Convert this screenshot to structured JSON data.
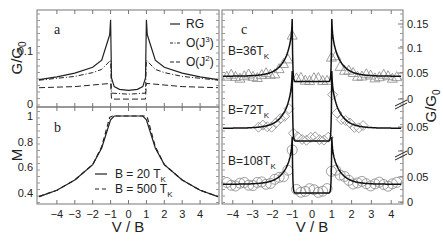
{
  "chart_data": [
    {
      "panel": "a",
      "type": "line",
      "xlabel": "",
      "ylabel": "G/G0",
      "xlim": [
        -5,
        5
      ],
      "ylim": [
        0,
        0.17
      ],
      "yticks": [
        "0",
        "0.1"
      ],
      "legend": [
        "RG",
        "O(J^3)",
        "O(J^2)"
      ],
      "legend_position": "upper right",
      "series": [
        {
          "name": "RG",
          "style": "solid",
          "x": [
            -5,
            -4,
            -3,
            -2,
            -1.5,
            -1.05,
            -1,
            -0.95,
            -0.8,
            -0.5,
            0,
            0.5,
            0.8,
            0.95,
            1,
            1.05,
            1.5,
            2,
            3,
            4,
            5
          ],
          "y": [
            0.047,
            0.052,
            0.059,
            0.07,
            0.083,
            0.13,
            0.158,
            0.05,
            0.034,
            0.029,
            0.027,
            0.029,
            0.034,
            0.05,
            0.158,
            0.13,
            0.083,
            0.07,
            0.059,
            0.052,
            0.047
          ]
        },
        {
          "name": "O(J^3)",
          "style": "dash-dot",
          "x": [
            -5,
            -3,
            -2,
            -1.5,
            -1,
            -0.95,
            0,
            0.95,
            1,
            1.5,
            2,
            3,
            5
          ],
          "y": [
            0.046,
            0.053,
            0.06,
            0.066,
            0.083,
            0.022,
            0.02,
            0.022,
            0.083,
            0.066,
            0.06,
            0.053,
            0.046
          ]
        },
        {
          "name": "O(J^2)",
          "style": "dashed",
          "x": [
            -5,
            -3,
            -1,
            -0.95,
            0,
            0.95,
            1,
            3,
            5
          ],
          "y": [
            0.032,
            0.034,
            0.04,
            0.011,
            0.011,
            0.011,
            0.04,
            0.034,
            0.032
          ]
        }
      ]
    },
    {
      "panel": "b",
      "type": "line",
      "xlabel": "V / B",
      "ylabel": "M",
      "xlim": [
        -5,
        5
      ],
      "ylim": [
        0.35,
        1.03
      ],
      "xticks": [
        "-4",
        "-3",
        "-2",
        "-1",
        "0",
        "1",
        "2",
        "3",
        "4"
      ],
      "yticks": [
        "0.4",
        "0.6",
        "0.8",
        "1"
      ],
      "legend": [
        "B = 20 T_K",
        "B = 500 T_K"
      ],
      "series": [
        {
          "name": "B = 20 T_K",
          "style": "solid",
          "x": [
            -5,
            -4,
            -3,
            -2,
            -1.5,
            -1,
            -0.8,
            0,
            0.8,
            1,
            1.5,
            2,
            3,
            4,
            5
          ],
          "y": [
            0.37,
            0.42,
            0.5,
            0.62,
            0.75,
            0.97,
            1.0,
            1.0,
            1.0,
            0.97,
            0.75,
            0.62,
            0.5,
            0.42,
            0.37
          ]
        },
        {
          "name": "B = 500 T_K",
          "style": "dashed",
          "x": [
            -5,
            -4,
            -3,
            -2,
            -1.5,
            -1.05,
            -0.9,
            0,
            0.9,
            1.05,
            1.5,
            2,
            3,
            4,
            5
          ],
          "y": [
            0.37,
            0.42,
            0.5,
            0.62,
            0.76,
            0.99,
            1.0,
            1.0,
            1.0,
            0.99,
            0.76,
            0.62,
            0.5,
            0.42,
            0.37
          ]
        }
      ]
    },
    {
      "panel": "c",
      "type": "scatter+line",
      "xlabel": "V / B",
      "ylabel": "G/G0",
      "xlim": [
        -4.6,
        4.6
      ],
      "xticks": [
        "-4",
        "-3",
        "-2",
        "-1",
        "0",
        "1",
        "2",
        "3",
        "4"
      ],
      "yticks_right": [
        "0",
        "0.05",
        "0.1",
        "0.15",
        "0",
        "0.05",
        "0",
        "0.05"
      ],
      "series": [
        {
          "name": "B=36T_K",
          "marker": "triangle",
          "theory_peak": 0.16,
          "baseline": 0.045,
          "center_min": 0.035
        },
        {
          "name": "B=72T_K",
          "marker": "diamond",
          "theory_peak": 0.16,
          "baseline": 0.045,
          "center_min": 0.02
        },
        {
          "name": "B=108T_K",
          "marker": "circle",
          "theory_peak": 0.13,
          "baseline": 0.035,
          "center_min": 0.018
        }
      ]
    }
  ],
  "labels": {
    "panel_a": "a",
    "panel_b": "b",
    "panel_c": "c",
    "ylabel_a": "G/G",
    "ylabel_a_sub": "0",
    "ylabel_b": "M",
    "ylabel_c": "G/G",
    "ylabel_c_sub": "0",
    "xlabel": "V / B",
    "legend_a": [
      "RG",
      "O(J",
      "O(J"
    ],
    "legend_a_sup": [
      "",
      "3",
      "2"
    ],
    "legend_a_close": [
      "",
      ")",
      ")"
    ],
    "legend_b": [
      "B = 20 T",
      "B = 500 T"
    ],
    "legend_b_sub": "K",
    "c_labels": [
      "B=36T",
      "B=72T",
      "B=108T"
    ],
    "c_sub": "K",
    "xticks": [
      "-4",
      "-3",
      "-2",
      "-1",
      "0",
      "1",
      "2",
      "3",
      "4"
    ],
    "a_yticks": [
      "0.1",
      "0"
    ],
    "b_yticks": [
      "1",
      "0.8",
      "0.6",
      "0.4"
    ],
    "c_yticks": [
      "0.15",
      "0.1",
      "0.05",
      "0",
      "0.05",
      "0",
      "0.05",
      "0"
    ]
  }
}
